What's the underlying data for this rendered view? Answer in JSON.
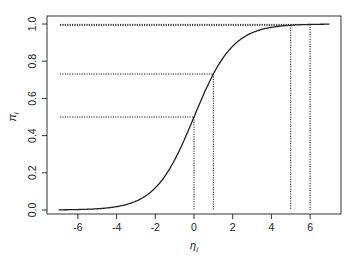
{
  "chart_data": {
    "type": "line",
    "title": "",
    "xlabel": "η_i",
    "ylabel": "π_i",
    "xlim": [
      -7.5,
      7.5
    ],
    "ylim": [
      -0.04,
      1.04
    ],
    "grid": false,
    "legend": null,
    "x_ticks": [
      -6,
      -4,
      -2,
      0,
      2,
      4,
      6
    ],
    "x_tick_labels": [
      "-6",
      "-4",
      "-2",
      "0",
      "2",
      "4",
      "6"
    ],
    "y_ticks": [
      0.0,
      0.2,
      0.4,
      0.6,
      0.8,
      1.0
    ],
    "y_tick_labels": [
      "0.0",
      "0.2",
      "0.4",
      "0.6",
      "0.8",
      "1.0"
    ],
    "series": [
      {
        "name": "logistic curve",
        "function": "pi = exp(eta) / (1 + exp(eta))",
        "x_range": [
          -7,
          7
        ],
        "x": [
          -7,
          -6,
          -5,
          -4,
          -3,
          -2,
          -1,
          0,
          1,
          2,
          3,
          4,
          5,
          6,
          7
        ],
        "values": [
          0.0009,
          0.0025,
          0.0067,
          0.018,
          0.0474,
          0.1192,
          0.2689,
          0.5,
          0.7311,
          0.8808,
          0.9526,
          0.982,
          0.9933,
          0.9975,
          0.9991
        ],
        "style": "solid"
      }
    ],
    "reference_lines": [
      {
        "eta": 0,
        "pi": 0.5,
        "style": "dotted"
      },
      {
        "eta": 1,
        "pi": 0.731,
        "style": "dotted"
      },
      {
        "eta": 5,
        "pi": 0.993,
        "style": "dotted"
      },
      {
        "eta": 6,
        "pi": 0.998,
        "style": "dotted"
      }
    ],
    "annotations": []
  },
  "colors": {
    "line": "#222222",
    "axis": "#333333",
    "background": "#ffffff"
  }
}
